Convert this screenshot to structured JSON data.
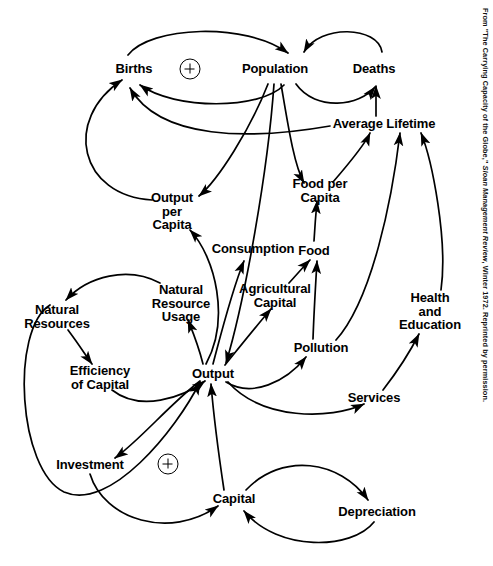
{
  "figure": {
    "credit_line": "From \"The Carrying Capacity of the Globe,\" Sloan Management Review, Winter 1972. Reprinted by permission.",
    "credit_prefix": "From \"The Carrying Capacity of the Globe,\" ",
    "credit_italic": "Sloan Management Review",
    "credit_suffix": ", Winter 1972. Reprinted by permission.",
    "background_color": "#ffffff",
    "ink_color": "#000000"
  },
  "diagram": {
    "type": "causal-loop",
    "width": 493,
    "height": 566,
    "nodes": [
      {
        "id": "births",
        "label": "Births",
        "lines": [
          "Births"
        ],
        "x": 134,
        "y": 69
      },
      {
        "id": "population",
        "label": "Population",
        "lines": [
          "Population"
        ],
        "x": 275,
        "y": 69
      },
      {
        "id": "deaths",
        "label": "Deaths",
        "lines": [
          "Deaths"
        ],
        "x": 374,
        "y": 69
      },
      {
        "id": "average-lifetime",
        "label": "Average Lifetime",
        "lines": [
          "Average Lifetime"
        ],
        "x": 384,
        "y": 124
      },
      {
        "id": "output-per-capita",
        "label": "Output per Capita",
        "lines": [
          "Output",
          "per",
          "Capita"
        ],
        "x": 172,
        "y": 211
      },
      {
        "id": "food-per-capita",
        "label": "Food per Capita",
        "lines": [
          "Food per",
          "Capita"
        ],
        "x": 320,
        "y": 190
      },
      {
        "id": "consumption",
        "label": "Consumption",
        "lines": [
          "Consumption"
        ],
        "x": 253,
        "y": 249
      },
      {
        "id": "food",
        "label": "Food",
        "lines": [
          "Food"
        ],
        "x": 314,
        "y": 251
      },
      {
        "id": "natural-resource-usage",
        "label": "Natural Resource Usage",
        "lines": [
          "Natural",
          "Resource",
          "Usage"
        ],
        "x": 181,
        "y": 303
      },
      {
        "id": "agricultural-capital",
        "label": "Agricultural Capital",
        "lines": [
          "Agricultural",
          "Capital"
        ],
        "x": 275,
        "y": 295
      },
      {
        "id": "natural-resources",
        "label": "Natural Resources",
        "lines": [
          "Natural",
          "Resources"
        ],
        "x": 57,
        "y": 316
      },
      {
        "id": "health-and-education",
        "label": "Health and Education",
        "lines": [
          "Health",
          "and",
          "Education"
        ],
        "x": 430,
        "y": 311
      },
      {
        "id": "pollution",
        "label": "Pollution",
        "lines": [
          "Pollution"
        ],
        "x": 321,
        "y": 348
      },
      {
        "id": "efficiency-of-capital",
        "label": "Efficiency of Capital",
        "lines": [
          "Efficiency",
          "of Capital"
        ],
        "x": 100,
        "y": 377
      },
      {
        "id": "output",
        "label": "Output",
        "lines": [
          "Output"
        ],
        "x": 213,
        "y": 374
      },
      {
        "id": "services",
        "label": "Services",
        "lines": [
          "Services"
        ],
        "x": 374,
        "y": 398
      },
      {
        "id": "investment",
        "label": "Investment",
        "lines": [
          "Investment"
        ],
        "x": 90,
        "y": 465
      },
      {
        "id": "capital",
        "label": "Capital",
        "lines": [
          "Capital"
        ],
        "x": 234,
        "y": 499
      },
      {
        "id": "depreciation",
        "label": "Depreciation",
        "lines": [
          "Depreciation"
        ],
        "x": 377,
        "y": 512
      }
    ],
    "polarity_markers": [
      {
        "id": "loop-plus-population",
        "symbol": "+",
        "x": 190,
        "y": 69,
        "loop": "Births / Population reinforcing loop"
      },
      {
        "id": "loop-plus-capital",
        "symbol": "+",
        "x": 168,
        "y": 464,
        "loop": "Investment / Capital reinforcing loop"
      }
    ],
    "edges": [
      {
        "from": "births",
        "to": "population"
      },
      {
        "from": "population",
        "to": "births"
      },
      {
        "from": "population",
        "to": "deaths"
      },
      {
        "from": "deaths",
        "to": "population"
      },
      {
        "from": "average-lifetime",
        "to": "deaths"
      },
      {
        "from": "average-lifetime",
        "to": "births"
      },
      {
        "from": "output-per-capita",
        "to": "births"
      },
      {
        "from": "population",
        "to": "output-per-capita"
      },
      {
        "from": "population",
        "to": "food-per-capita"
      },
      {
        "from": "population",
        "to": "output"
      },
      {
        "from": "food-per-capita",
        "to": "average-lifetime"
      },
      {
        "from": "food",
        "to": "food-per-capita"
      },
      {
        "from": "agricultural-capital",
        "to": "food"
      },
      {
        "from": "pollution",
        "to": "food"
      },
      {
        "from": "pollution",
        "to": "average-lifetime"
      },
      {
        "from": "health-and-education",
        "to": "average-lifetime"
      },
      {
        "from": "services",
        "to": "health-and-education"
      },
      {
        "from": "output",
        "to": "services"
      },
      {
        "from": "output",
        "to": "pollution"
      },
      {
        "from": "output",
        "to": "agricultural-capital"
      },
      {
        "from": "output",
        "to": "consumption"
      },
      {
        "from": "output",
        "to": "output-per-capita"
      },
      {
        "from": "output",
        "to": "natural-resource-usage"
      },
      {
        "from": "natural-resource-usage",
        "to": "natural-resources"
      },
      {
        "from": "natural-resources",
        "to": "efficiency-of-capital"
      },
      {
        "from": "efficiency-of-capital",
        "to": "output"
      },
      {
        "from": "output",
        "to": "investment"
      },
      {
        "from": "investment",
        "to": "capital"
      },
      {
        "from": "capital",
        "to": "output"
      },
      {
        "from": "capital",
        "to": "depreciation"
      },
      {
        "from": "depreciation",
        "to": "capital"
      },
      {
        "from": "natural-resources",
        "to": "output"
      }
    ]
  }
}
